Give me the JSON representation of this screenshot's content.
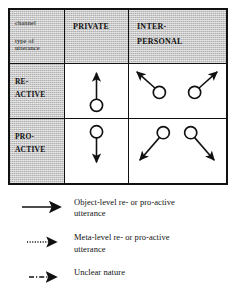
{
  "figure": {
    "ink_color": "#111111",
    "shade_color": "#c9c9c9",
    "background": "#ffffff"
  },
  "matrix": {
    "corner": {
      "line1": "channel",
      "line2_a": "type of",
      "line2_b": "utterance"
    },
    "columns": [
      {
        "id": "private",
        "label_line1": "PRIVATE",
        "label_line2": ""
      },
      {
        "id": "interpersonal",
        "label_line1": "INTER-",
        "label_line2": "PERSONAL"
      }
    ],
    "rows": [
      {
        "id": "reactive",
        "label_line1": "RE-",
        "label_line2": "ACTIVE"
      },
      {
        "id": "proactive",
        "label_line1": "PRO-",
        "label_line2": "ACTIVE"
      }
    ],
    "cells": [
      {
        "id": "private-reactive",
        "row": "reactive",
        "column": "private",
        "nodes": 1,
        "arrows": 1,
        "arrow_direction": "up",
        "description": "one circle with a single arrow pointing straight up"
      },
      {
        "id": "interpersonal-reactive",
        "row": "reactive",
        "column": "interpersonal",
        "nodes": 2,
        "arrows": 2,
        "arrow_direction": "up-left and up-right",
        "description": "two circles, each with an arrow pointing diagonally upward and outward"
      },
      {
        "id": "private-proactive",
        "row": "proactive",
        "column": "private",
        "nodes": 1,
        "arrows": 1,
        "arrow_direction": "down",
        "description": "one circle with a single arrow pointing straight down"
      },
      {
        "id": "interpersonal-proactive",
        "row": "proactive",
        "column": "interpersonal",
        "nodes": 2,
        "arrows": 2,
        "arrow_direction": "down-left and down-right",
        "description": "two circles, each with an arrow pointing diagonally downward and outward"
      }
    ]
  },
  "legend": {
    "items": [
      {
        "id": "object-level",
        "line_style": "solid",
        "text_line1": "Object-level re- or pro-active",
        "text_line2": "utterance"
      },
      {
        "id": "meta-level",
        "line_style": "dotted",
        "text_line1": "Meta-level re- or pro-active",
        "text_line2": "utterance"
      },
      {
        "id": "unclear",
        "line_style": "dash-dot",
        "text_line1": "Unclear nature",
        "text_line2": ""
      }
    ]
  }
}
